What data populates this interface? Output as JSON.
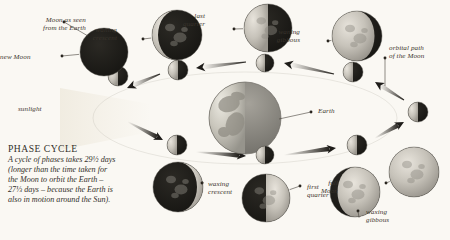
{
  "figure": {
    "title": "PHASE CYCLE",
    "body": "A cycle of phases takes 29½ days\n(longer than the time taken for\nthe Moon to orbit the Earth –\n27⅓ days – because the Earth is\nalso in motion around the Sun).",
    "background_color": "#faf8f3",
    "ink_color": "#33302a"
  },
  "annotations": {
    "moon_as_seen": "Moon as seen\nfrom the Earth",
    "sunlight": "sunlight",
    "earth": "Earth",
    "orbital_path": "orbital path\nof the Moon"
  },
  "phases": [
    {
      "key": "new-moon",
      "label": "new Moon",
      "illumination": 0.0,
      "lit_side": "none",
      "outer": {
        "cx": 104,
        "cy": 52,
        "r": 24
      },
      "inner": {
        "cx": 118,
        "cy": 76,
        "r": 10,
        "lit_side": "left"
      },
      "label_pos": {
        "x": 22,
        "y": 53,
        "align": "right"
      },
      "dot": {
        "x": 62,
        "y": 56
      }
    },
    {
      "key": "waning-crescent",
      "label": "waning\ncrescent",
      "illumination": 0.12,
      "lit_side": "left",
      "outer": {
        "cx": 177,
        "cy": 35,
        "r": 25
      },
      "inner": {
        "cx": 178,
        "cy": 70,
        "r": 10,
        "lit_side": "left"
      },
      "label_pos": {
        "x": 117,
        "y": 26,
        "align": "right"
      },
      "dot": {
        "x": 143,
        "y": 39
      }
    },
    {
      "key": "last-quarter",
      "label": "last\nquarter",
      "illumination": 0.5,
      "lit_side": "left",
      "outer": {
        "cx": 268,
        "cy": 28,
        "r": 24
      },
      "inner": {
        "cx": 265,
        "cy": 63,
        "r": 9,
        "lit_side": "left"
      },
      "label_pos": {
        "x": 205,
        "y": 12,
        "align": "right"
      },
      "dot": {
        "x": 234,
        "y": 29
      }
    },
    {
      "key": "waning-gibbous",
      "label": "waning\ngibbous",
      "illumination": 0.85,
      "lit_side": "left",
      "outer": {
        "cx": 357,
        "cy": 36,
        "r": 25
      },
      "inner": {
        "cx": 353,
        "cy": 72,
        "r": 10,
        "lit_side": "left"
      },
      "label_pos": {
        "x": 300,
        "y": 28,
        "align": "right"
      },
      "dot": {
        "x": 328,
        "y": 41
      }
    },
    {
      "key": "full-moon",
      "label": "full\nMoon",
      "illumination": 1.0,
      "lit_side": "full",
      "outer": {
        "cx": 414,
        "cy": 172,
        "r": 25
      },
      "inner": {
        "cx": 418,
        "cy": 112,
        "r": 10,
        "lit_side": "left"
      },
      "label_pos": {
        "x": 338,
        "y": 179,
        "align": "right"
      },
      "dot": {
        "x": 386,
        "y": 183
      }
    },
    {
      "key": "waxing-gibbous",
      "label": "waxing\ngibbous",
      "illumination": 0.85,
      "lit_side": "right",
      "outer": {
        "cx": 355,
        "cy": 192,
        "r": 25
      },
      "inner": {
        "cx": 357,
        "cy": 145,
        "r": 10,
        "lit_side": "left"
      },
      "label_pos": {
        "x": 366,
        "y": 208,
        "align": "left"
      },
      "dot": {
        "x": 358,
        "y": 211
      }
    },
    {
      "key": "first-quarter",
      "label": "first\nquarter",
      "illumination": 0.5,
      "lit_side": "right",
      "outer": {
        "cx": 266,
        "cy": 198,
        "r": 24
      },
      "inner": {
        "cx": 265,
        "cy": 155,
        "r": 9,
        "lit_side": "left"
      },
      "label_pos": {
        "x": 307,
        "y": 183,
        "align": "left"
      },
      "dot": {
        "x": 300,
        "y": 186
      }
    },
    {
      "key": "waxing-crescent",
      "label": "waxing\ncrescent",
      "illumination": 0.12,
      "lit_side": "right",
      "outer": {
        "cx": 178,
        "cy": 187,
        "r": 25
      },
      "inner": {
        "cx": 177,
        "cy": 145,
        "r": 10,
        "lit_side": "left"
      },
      "label_pos": {
        "x": 208,
        "y": 180,
        "align": "left"
      },
      "dot": {
        "x": 202,
        "y": 183
      }
    }
  ],
  "earth": {
    "cx": 245,
    "cy": 118,
    "r": 36,
    "lit_side": "left",
    "label_dot": {
      "x": 311,
      "y": 112
    }
  },
  "arrows": [
    {
      "name": "arrow-last-to-waning-crescent",
      "from": [
        246,
        62
      ],
      "to": [
        196,
        68
      ],
      "dir": "left"
    },
    {
      "name": "arrow-waning-gibbous-to-last",
      "from": [
        334,
        74
      ],
      "to": [
        284,
        63
      ],
      "dir": "left"
    },
    {
      "name": "arrow-waning-crescent-to-new",
      "from": [
        160,
        74
      ],
      "to": [
        127,
        88
      ],
      "dir": "downleft"
    },
    {
      "name": "arrow-new-to-waxing-crescent",
      "from": [
        128,
        122
      ],
      "to": [
        163,
        140
      ],
      "dir": "downright"
    },
    {
      "name": "arrow-waxing-crescent-to-first",
      "from": [
        196,
        152
      ],
      "to": [
        246,
        156
      ],
      "dir": "right"
    },
    {
      "name": "arrow-first-to-waxing-gibbous",
      "from": [
        284,
        155
      ],
      "to": [
        336,
        148
      ],
      "dir": "right"
    },
    {
      "name": "arrow-waxing-gibbous-to-full",
      "from": [
        375,
        138
      ],
      "to": [
        404,
        122
      ],
      "dir": "upright"
    },
    {
      "name": "arrow-full-to-waning-gibbous",
      "from": [
        404,
        100
      ],
      "to": [
        375,
        82
      ],
      "dir": "upleft"
    }
  ]
}
